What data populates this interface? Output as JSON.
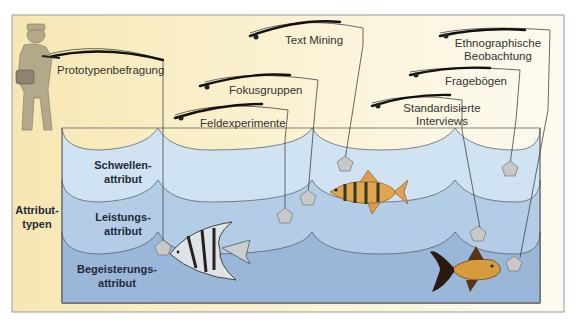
{
  "diagram": {
    "type": "illustration",
    "title": "",
    "side_label": {
      "line1": "Attribut-",
      "line2": "typen"
    },
    "bands": [
      {
        "id": "schwellen",
        "line1": "Schwellen-",
        "line2": "attribut",
        "color": "#cfe3f3"
      },
      {
        "id": "leistungs",
        "line1": "Leistungs-",
        "line2": "attribut",
        "color": "#b3cde6"
      },
      {
        "id": "begeisterungs",
        "line1": "Begeisterungs-",
        "line2": "attribut",
        "color": "#9ab7d9"
      }
    ],
    "methods": [
      {
        "id": "prototypenbefragung",
        "label": "Prototypenbefragung",
        "reaches_band": "begeisterungs"
      },
      {
        "id": "text-mining",
        "label": "Text Mining",
        "reaches_band": "schwellen"
      },
      {
        "id": "fokusgruppen",
        "label": "Fokusgruppen",
        "reaches_band": "leistungs"
      },
      {
        "id": "feldexperimente",
        "label": "Feldexperimente",
        "reaches_band": "leistungs"
      },
      {
        "id": "ethnographische-beobachtung",
        "label_line1": "Ethnographische",
        "label_line2": "Beobachtung",
        "reaches_band": "begeisterungs"
      },
      {
        "id": "frageboegen",
        "label": "Fragebögen",
        "reaches_band": "schwellen"
      },
      {
        "id": "standardisierte-interviews",
        "label_line1": "Standardisierte",
        "label_line2": "Interviews",
        "reaches_band": "leistungs"
      }
    ],
    "colors": {
      "background_sand": "#f8ecbe",
      "background_light": "#fbf6e2",
      "frame_border": "#9a9a9a",
      "fisherman": "#b3a98a",
      "line": "#444444",
      "sinker": "#c8c8c8"
    }
  }
}
